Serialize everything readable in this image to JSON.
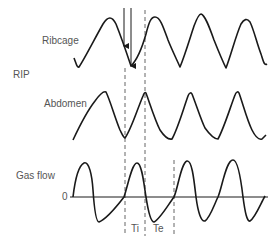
{
  "labels": {
    "ribcage": "Ribcage",
    "rip": "RIP",
    "abdomen": "Abdomen",
    "gas_flow": "Gas flow",
    "zero": "0",
    "ti": "Ti",
    "te": "Te"
  },
  "colors": {
    "trace": "#1a1a1a",
    "dashed": "#666666",
    "text": "#555555",
    "background": "#ffffff"
  },
  "traces": {
    "ribcage": "M74,58 C76,63 77,68 79,67 C85,58 95,38 103,24 C108,16 112,16 116,24 C120,34 125,48 131,66 C137,60 142,48 146,34 C149,22 151,17 155,17 C160,17 163,26 168,40 C172,50 176,58 180,67 C185,55 190,38 194,26 C197,18 199,14 201,14 C205,15 209,26 214,40 C218,50 222,60 226,68 C231,55 236,35 241,24 C244,19 247,18 250,22 C254,30 257,44 261,54 C263,60 264,66 267,64",
    "abdomen": "M73,140 C80,125 88,110 95,101 C100,94 104,91 106,92 C110,100 115,118 120,130 C122,134 123,137 125,138 C131,130 137,110 143,96 C144,93 145,92 146,93 C150,104 155,120 160,130 C164,136 168,140 172,139 C178,128 183,110 188,96 C189,93 191,92 192,94 C196,104 201,120 205,128 C210,135 214,139 218,139 C224,128 230,108 235,95 C236,92 238,91 239,93 C243,104 247,120 252,130 C255,136 259,140 262,139 C264,137 265,136 266,135",
    "gas_flow": "M73,197 C75,180 78,166 84,163 C89,161 92,175 93,190 C94,205 96,222 99,222 C104,220 114,210 124,197 C128,185 132,163 137,163 C142,163 144,185 146,197 C148,210 151,222 154,222 C160,219 168,205 174,197 C178,188 181,163 187,161 C192,160 194,180 196,197 C198,212 201,222 205,221 C210,218 214,205 218,197 C222,188 226,160 233,160 C238,160 241,180 243,197 C245,212 247,222 250,221 C255,218 260,205 265,196"
  },
  "dashed_lines": [
    {
      "x": 125,
      "y1": 68,
      "y2": 236
    },
    {
      "x": 145,
      "y1": 10,
      "y2": 236
    },
    {
      "x": 174,
      "y1": 160,
      "y2": 236
    }
  ],
  "arrows": [
    {
      "x": 124,
      "y1": 8,
      "y2": 46
    },
    {
      "x": 131,
      "y1": 8,
      "y2": 66
    }
  ],
  "zero_line": {
    "x1": 70,
    "x2": 268,
    "y": 197
  }
}
